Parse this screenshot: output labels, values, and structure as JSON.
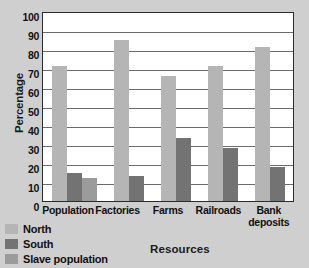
{
  "chart_data": {
    "type": "bar",
    "title": "",
    "xlabel": "Resources",
    "ylabel": "Percentage",
    "categories": [
      "Population",
      "Factories",
      "Farms",
      "Railroads",
      "Bank deposits"
    ],
    "category_lines": [
      [
        "Population"
      ],
      [
        "Factories"
      ],
      [
        "Farms"
      ],
      [
        "Railroads"
      ],
      [
        "Bank",
        "deposits"
      ]
    ],
    "series": [
      {
        "name": "North",
        "color": "#b5b5b5",
        "values": [
          71,
          85,
          66,
          71,
          81
        ]
      },
      {
        "name": "South",
        "color": "#737373",
        "values": [
          15,
          13,
          33,
          28,
          18
        ]
      },
      {
        "name": "Slave population",
        "color": "#9b9b9b",
        "values": [
          12,
          null,
          null,
          null,
          null
        ]
      }
    ],
    "ylim": [
      0,
      100
    ],
    "yticks": [
      100,
      90,
      80,
      70,
      60,
      50,
      40,
      30,
      20,
      10,
      0
    ],
    "grid": true,
    "legend_position": "bottom-left",
    "background": "#cfcfcf",
    "plot_background": "#ffffff",
    "axis_color": "#2b2b2b",
    "grid_color": "#6b6b6b"
  },
  "legend": {
    "items": [
      {
        "label": "North",
        "color": "#b5b5b5"
      },
      {
        "label": "South",
        "color": "#737373"
      },
      {
        "label": "Slave population",
        "color": "#9b9b9b"
      }
    ]
  }
}
